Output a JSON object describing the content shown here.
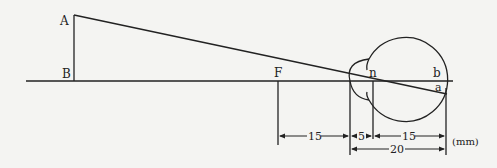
{
  "labels": {
    "A": "A",
    "B": "B",
    "F": "F",
    "n": "n",
    "b": "b",
    "a": "a"
  },
  "dimensions": {
    "focal_to_cornea": "15",
    "cornea_to_nodal": "5",
    "nodal_to_retina": "15",
    "cornea_to_retina": "20",
    "unit": "(mm)"
  },
  "colors": {
    "line": "#222222",
    "background": "#f4f4f2"
  }
}
